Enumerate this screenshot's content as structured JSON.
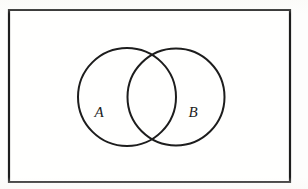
{
  "figure": {
    "type": "venn-diagram",
    "stroke_color": "#1d1d1d",
    "background_color": "#fdfdfc",
    "universe": {
      "name": "universal-set-rectangle",
      "x": 9,
      "y": 10,
      "width": 281,
      "height": 172,
      "stroke_width": 2.2
    },
    "circles": [
      {
        "name": "set-a-circle",
        "label": "A",
        "cx": 127,
        "cy": 97,
        "r": 49,
        "stroke_width": 2.0,
        "label_x": 99,
        "label_y": 114
      },
      {
        "name": "set-b-circle",
        "label": "B",
        "cx": 176,
        "cy": 97,
        "r": 48.5,
        "stroke_width": 2.0,
        "label_x": 193,
        "label_y": 114
      }
    ],
    "labels": {
      "set_a": "A",
      "set_b": "B"
    }
  }
}
